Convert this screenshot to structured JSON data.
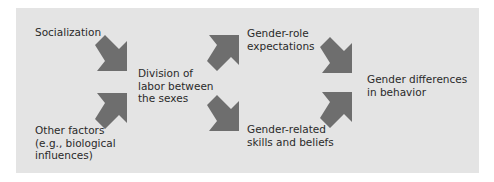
{
  "diagram": {
    "background_color": "#e4e4e4",
    "arrow_color": "#6e6e6e",
    "nodes": [
      {
        "id": "socialization",
        "lines": [
          "Socialization"
        ]
      },
      {
        "id": "other-factors",
        "lines": [
          "Other factors",
          "(e.g., biological",
          "influences)"
        ]
      },
      {
        "id": "division-of-labor",
        "lines": [
          "Division of",
          "labor between",
          "the sexes"
        ]
      },
      {
        "id": "gender-role-expectations",
        "lines": [
          "Gender-role",
          "expectations"
        ]
      },
      {
        "id": "gender-related-skills",
        "lines": [
          "Gender-related",
          "skills and beliefs"
        ]
      },
      {
        "id": "gender-differences",
        "lines": [
          "Gender differences",
          "in behavior"
        ]
      }
    ],
    "edges": [
      {
        "from": "socialization",
        "to": "division-of-labor"
      },
      {
        "from": "other-factors",
        "to": "division-of-labor"
      },
      {
        "from": "division-of-labor",
        "to": "gender-role-expectations"
      },
      {
        "from": "division-of-labor",
        "to": "gender-related-skills"
      },
      {
        "from": "gender-role-expectations",
        "to": "gender-differences"
      },
      {
        "from": "gender-related-skills",
        "to": "gender-differences"
      }
    ]
  }
}
